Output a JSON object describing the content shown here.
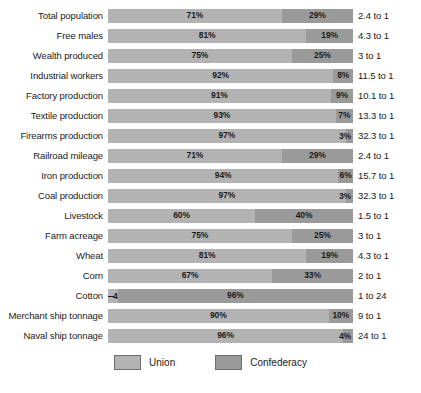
{
  "chart_data": {
    "type": "bar",
    "title": "",
    "subtitle": "",
    "xlabel": "",
    "ylabel": "",
    "orientation": "horizontal",
    "stacked": true,
    "normalized_percent": true,
    "xlim": [
      0,
      100
    ],
    "grid": false,
    "legend_position": "bottom-center",
    "categories": [
      "Total population",
      "Free males",
      "Wealth produced",
      "Industrial workers",
      "Factory production",
      "Textile production",
      "Firearms production",
      "Railroad mileage",
      "Iron production",
      "Coal production",
      "Livestock",
      "Farm acreage",
      "Wheat",
      "Corn",
      "Cotton",
      "Merchant ship tonnage",
      "Naval ship tonnage"
    ],
    "series": [
      {
        "name": "Union",
        "color": "#b3b3b3",
        "values": [
          71,
          81,
          75,
          92,
          91,
          93,
          97,
          71,
          94,
          97,
          60,
          75,
          81,
          67,
          4,
          90,
          96
        ]
      },
      {
        "name": "Confederacy",
        "color": "#9a9a9a",
        "values": [
          29,
          19,
          25,
          8,
          9,
          7,
          3,
          29,
          6,
          3,
          40,
          25,
          19,
          33,
          96,
          10,
          4
        ]
      }
    ],
    "ratios": [
      "2.4 to 1",
      "4.3 to 1",
      "3 to 1",
      "11.5 to 1",
      "10.1 to 1",
      "13.3 to 1",
      "32.3 to 1",
      "2.4 to 1",
      "15.7 to 1",
      "32.3 to 1",
      "1.5 to 1",
      "3 to 1",
      "4.3 to 1",
      "2 to 1",
      "1 to 24",
      "9 to 1",
      "24 to 1"
    ]
  },
  "rows": [
    {
      "label": "Total population",
      "union": "71%",
      "conf": "29%",
      "ratio": "2.4 to 1",
      "union_pct": 71,
      "conf_pct": 29,
      "conf_tiny": false,
      "union_tiny": false
    },
    {
      "label": "Free males",
      "union": "81%",
      "conf": "19%",
      "ratio": "4.3 to 1",
      "union_pct": 81,
      "conf_pct": 19,
      "conf_tiny": false,
      "union_tiny": false
    },
    {
      "label": "Wealth produced",
      "union": "75%",
      "conf": "25%",
      "ratio": "3 to 1",
      "union_pct": 75,
      "conf_pct": 25,
      "conf_tiny": false,
      "union_tiny": false
    },
    {
      "label": "Industrial workers",
      "union": "92%",
      "conf": "8%",
      "ratio": "11.5 to 1",
      "union_pct": 92,
      "conf_pct": 8,
      "conf_tiny": false,
      "union_tiny": false
    },
    {
      "label": "Factory production",
      "union": "91%",
      "conf": "9%",
      "ratio": "10.1 to 1",
      "union_pct": 91,
      "conf_pct": 9,
      "conf_tiny": false,
      "union_tiny": false
    },
    {
      "label": "Textile production",
      "union": "93%",
      "conf": "7%",
      "ratio": "13.3 to 1",
      "union_pct": 93,
      "conf_pct": 7,
      "conf_tiny": false,
      "union_tiny": false
    },
    {
      "label": "Firearms production",
      "union": "97%",
      "conf": "3%",
      "ratio": "32.3 to 1",
      "union_pct": 97,
      "conf_pct": 3,
      "conf_tiny": true,
      "union_tiny": false
    },
    {
      "label": "Railroad mileage",
      "union": "71%",
      "conf": "29%",
      "ratio": "2.4 to 1",
      "union_pct": 71,
      "conf_pct": 29,
      "conf_tiny": false,
      "union_tiny": false
    },
    {
      "label": "Iron production",
      "union": "94%",
      "conf": "6%",
      "ratio": "15.7 to 1",
      "union_pct": 94,
      "conf_pct": 6,
      "conf_tiny": false,
      "union_tiny": false
    },
    {
      "label": "Coal production",
      "union": "97%",
      "conf": "3%",
      "ratio": "32.3 to 1",
      "union_pct": 97,
      "conf_pct": 3,
      "conf_tiny": true,
      "union_tiny": false
    },
    {
      "label": "Livestock",
      "union": "60%",
      "conf": "40%",
      "ratio": "1.5 to 1",
      "union_pct": 60,
      "conf_pct": 40,
      "conf_tiny": false,
      "union_tiny": false
    },
    {
      "label": "Farm acreage",
      "union": "75%",
      "conf": "25%",
      "ratio": "3 to 1",
      "union_pct": 75,
      "conf_pct": 25,
      "conf_tiny": false,
      "union_tiny": false
    },
    {
      "label": "Wheat",
      "union": "81%",
      "conf": "19%",
      "ratio": "4.3 to 1",
      "union_pct": 81,
      "conf_pct": 19,
      "conf_tiny": false,
      "union_tiny": false
    },
    {
      "label": "Corn",
      "union": "67%",
      "conf": "33%",
      "ratio": "2 to 1",
      "union_pct": 67,
      "conf_pct": 33,
      "conf_tiny": false,
      "union_tiny": false
    },
    {
      "label": "Cotton",
      "union": "4%",
      "conf": "96%",
      "ratio": "1 to 24",
      "union_pct": 4,
      "conf_pct": 96,
      "conf_tiny": false,
      "union_tiny": true
    },
    {
      "label": "Merchant ship tonnage",
      "union": "90%",
      "conf": "10%",
      "ratio": "9 to 1",
      "union_pct": 90,
      "conf_pct": 10,
      "conf_tiny": false,
      "union_tiny": false
    },
    {
      "label": "Naval ship tonnage",
      "union": "96%",
      "conf": "4%",
      "ratio": "24 to 1",
      "union_pct": 96,
      "conf_pct": 4,
      "conf_tiny": true,
      "union_tiny": false
    }
  ],
  "legend": {
    "items": [
      {
        "label": "Union",
        "color": "#b3b3b3"
      },
      {
        "label": "Confederacy",
        "color": "#9a9a9a"
      }
    ]
  },
  "leader_dash": "—"
}
